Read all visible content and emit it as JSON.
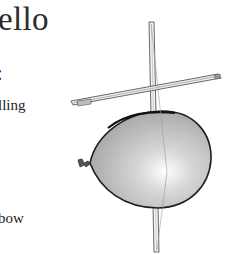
{
  "document": {
    "title_fragment": "ello",
    "colon_fragment": ":",
    "text_fragments": [
      "lling",
      "bow"
    ]
  },
  "illustration": {
    "subject": "balloon-with-violin-bow",
    "balloon_color": "#b8b8b8",
    "balloon_highlight": "#ffffff",
    "outline_color": "#1e1e1e"
  }
}
